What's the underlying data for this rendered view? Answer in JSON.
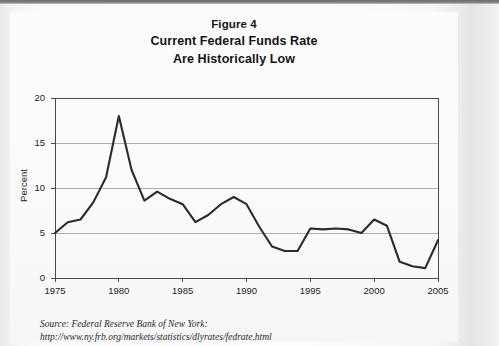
{
  "figure": {
    "title_line1": "Figure 4",
    "title_line2": "Current Federal Funds Rate",
    "title_line3": "Are Historically Low",
    "source_line1": "Source: Federal Reserve Bank of New York:",
    "source_line2": "http://www.ny.frb.org/markets/statistics/dlyrates/fedrate.html"
  },
  "colors": {
    "line": "#2b2b2b",
    "grid": "#9a9a9a",
    "axis": "#4a4a4a",
    "text": "#1c1c1c",
    "page": "#fbfbfb"
  },
  "chart_data": {
    "type": "line",
    "xlabel": "",
    "ylabel": "Percent",
    "xlim": [
      1975,
      2005
    ],
    "ylim": [
      0,
      20
    ],
    "grid": true,
    "legend": null,
    "xticks": [
      1975,
      1980,
      1985,
      1990,
      1995,
      2000,
      2005
    ],
    "yticks": [
      0,
      5,
      10,
      15,
      20
    ],
    "x": [
      1975,
      1976,
      1977,
      1978,
      1979,
      1980,
      1981,
      1982,
      1983,
      1984,
      1985,
      1986,
      1987,
      1988,
      1989,
      1990,
      1991,
      1992,
      1993,
      1994,
      1995,
      1996,
      1997,
      1998,
      1999,
      2000,
      2001,
      2002,
      2003,
      2004,
      2005
    ],
    "series": [
      {
        "name": "Federal Funds Rate",
        "values": [
          5.0,
          6.2,
          6.5,
          8.4,
          11.2,
          18.0,
          12.0,
          8.6,
          9.6,
          8.8,
          8.2,
          6.2,
          7.0,
          8.2,
          9.0,
          8.2,
          5.7,
          3.5,
          3.0,
          3.0,
          5.5,
          5.4,
          5.5,
          5.4,
          5.0,
          6.5,
          5.8,
          1.8,
          1.3,
          1.1,
          4.2
        ]
      }
    ]
  }
}
